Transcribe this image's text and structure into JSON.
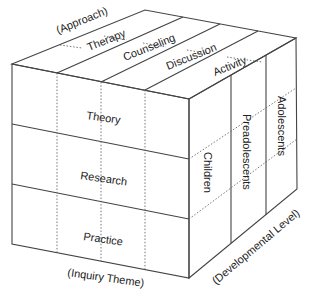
{
  "diagram": {
    "type": "3d-cube-framework",
    "axes": {
      "top": {
        "label": "(Approach)",
        "items": [
          "Therapy",
          "Counseling",
          "Discussion",
          "Activity"
        ]
      },
      "front": {
        "label": "(Inquiry Theme)",
        "items": [
          "Theory",
          "Research",
          "Practice"
        ]
      },
      "side": {
        "label": "(Developmental Level)",
        "items": [
          "Children",
          "Preadolescents",
          "Adolescents"
        ]
      }
    },
    "colors": {
      "line": "#444444",
      "text": "#222222",
      "background": "#ffffff"
    }
  }
}
